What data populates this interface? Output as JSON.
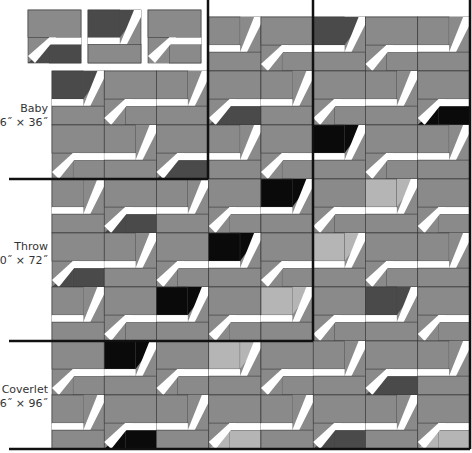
{
  "diagram": {
    "legend_blocks": [
      {
        "type": "A",
        "tone": "dark"
      },
      {
        "type": "B",
        "tone": "dark"
      },
      {
        "type": "A",
        "tone": "medium"
      }
    ],
    "sizes": [
      {
        "name": "Baby",
        "dimensions": "36˝ × 36˝"
      },
      {
        "name": "Throw",
        "dimensions": "60˝ × 72˝"
      },
      {
        "name": "Coverlet",
        "dimensions": "96˝ × 96˝"
      }
    ],
    "colors": {
      "medium": "#8a8a8a",
      "light": "#b5b5b5",
      "dark": "#4a4a4a",
      "black": "#0a0a0a",
      "strip": "#ffffff",
      "seam": "#3a3a3a",
      "border": "#111111"
    },
    "grid": {
      "cols": 8,
      "rows": 8,
      "left": 52,
      "top": 17,
      "block_w": 52.25,
      "block_h": 54
    },
    "blocks": [
      [
        "skip",
        "skip",
        "skip",
        "B:medium",
        "A:medium",
        "B:dark",
        "A:medium",
        "B:medium"
      ],
      [
        "B:dark",
        "A:medium",
        "B:medium",
        "A:dark",
        "B:medium",
        "A:medium",
        "B:medium",
        "A:black"
      ],
      [
        "A:medium",
        "B:medium",
        "A:dark",
        "B:medium",
        "A:medium",
        "B:black",
        "A:medium",
        "B:medium"
      ],
      [
        "B:medium",
        "A:dark",
        "B:medium",
        "A:medium",
        "B:black",
        "A:medium",
        "B:light",
        "A:medium"
      ],
      [
        "A:dark",
        "B:medium",
        "A:medium",
        "B:black",
        "A:medium",
        "B:light",
        "A:medium",
        "B:medium"
      ],
      [
        "B:medium",
        "A:medium",
        "B:black",
        "A:medium",
        "B:light",
        "A:medium",
        "B:dark",
        "A:medium"
      ],
      [
        "A:medium",
        "B:black",
        "A:medium",
        "B:light",
        "A:medium",
        "B:medium",
        "A:dark",
        "B:medium"
      ],
      [
        "B:medium",
        "A:black",
        "B:medium",
        "A:light",
        "B:medium",
        "A:dark",
        "B:medium",
        "A:light"
      ]
    ],
    "size_lines": [
      {
        "orient": "h",
        "y": 179,
        "x1": 9,
        "x2": 208
      },
      {
        "orient": "v",
        "x": 208,
        "y1": 0,
        "y2": 179
      },
      {
        "orient": "h",
        "y": 341,
        "x1": 9,
        "x2": 313
      },
      {
        "orient": "v",
        "x": 313,
        "y1": 0,
        "y2": 341
      },
      {
        "orient": "h",
        "y": 449,
        "x1": 9,
        "x2": 470
      },
      {
        "orient": "v",
        "x": 470,
        "y1": 0,
        "y2": 449
      }
    ]
  }
}
